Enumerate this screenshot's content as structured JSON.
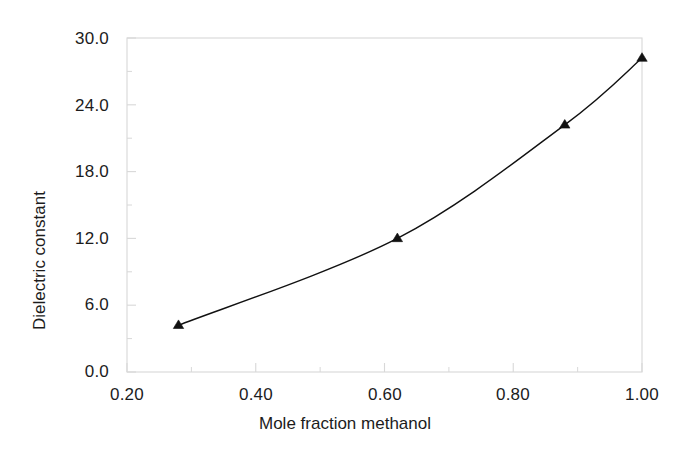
{
  "chart_data": {
    "type": "line",
    "title": "",
    "subtitle": "",
    "xlabel": "Mole fraction methanol",
    "ylabel": "Dielectric constant",
    "xlim": [
      0.2,
      1.0
    ],
    "ylim": [
      0.0,
      30.0
    ],
    "xticks": [
      0.2,
      0.4,
      0.6,
      0.8,
      1.0
    ],
    "xtick_labels": [
      "0.20",
      "0.40",
      "0.60",
      "0.80",
      "1.00"
    ],
    "yticks": [
      0.0,
      6.0,
      12.0,
      18.0,
      24.0,
      30.0
    ],
    "ytick_labels": [
      "0.0",
      "6.0",
      "12.0",
      "18.0",
      "24.0",
      "30.0"
    ],
    "minor_x_ticks": [
      0.3,
      0.5,
      0.7,
      0.9
    ],
    "minor_y_ticks": [
      3.0,
      9.0,
      15.0,
      21.0,
      27.0
    ],
    "grid": false,
    "legend": null,
    "legend_position": "none",
    "marker": "triangle-up",
    "marker_color": "#111111",
    "line_color": "#111111",
    "line_width": 1.4,
    "series": [
      {
        "name": "Dielectric constant vs mole fraction methanol",
        "x": [
          0.28,
          0.62,
          0.88,
          1.0
        ],
        "y": [
          4.2,
          12.0,
          22.2,
          28.2
        ]
      }
    ],
    "smooth": true,
    "axes_color": "#d8d8d8",
    "background": "#ffffff",
    "annotations": []
  },
  "figure": {
    "alt": "Line chart of dielectric constant versus mole fraction methanol"
  }
}
